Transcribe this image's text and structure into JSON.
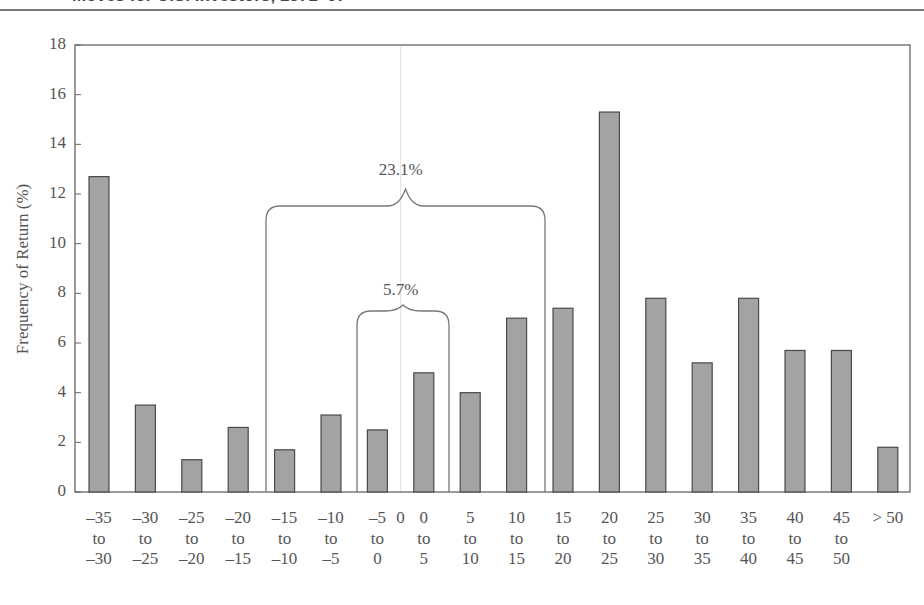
{
  "header": {
    "title_fragment": "Moves for U.S. Investors, 1871–07"
  },
  "chart_data": {
    "type": "bar",
    "title": "",
    "xlabel": "",
    "ylabel": "Frequency of Return (%)",
    "ylim": [
      0,
      18
    ],
    "yticks": [
      0,
      2,
      4,
      6,
      8,
      10,
      12,
      14,
      16,
      18
    ],
    "grid": false,
    "categories": [
      "-35 to -30",
      "-30 to -25",
      "-25 to -20",
      "-20 to -15",
      "-15 to -10",
      "-10 to -5",
      "-5 to 0",
      "0 to 5",
      "5 to 10",
      "10 to 15",
      "15 to 20",
      "20 to 25",
      "25 to 30",
      "30 to 35",
      "35 to 40",
      "40 to 45",
      "45 to 50",
      "> 50"
    ],
    "category_labels": [
      [
        "–35",
        "to",
        "–30"
      ],
      [
        "–30",
        "to",
        "–25"
      ],
      [
        "–25",
        "to",
        "–20"
      ],
      [
        "–20",
        "to",
        "–15"
      ],
      [
        "–15",
        "to",
        "–10"
      ],
      [
        "–10",
        "to",
        "–5"
      ],
      [
        "–5",
        "to",
        "0"
      ],
      [
        "0",
        "to",
        "5"
      ],
      [
        "5",
        "to",
        "10"
      ],
      [
        "10",
        "to",
        "15"
      ],
      [
        "15",
        "to",
        "20"
      ],
      [
        "20",
        "to",
        "25"
      ],
      [
        "25",
        "to",
        "30"
      ],
      [
        "30",
        "to",
        "35"
      ],
      [
        "35",
        "to",
        "40"
      ],
      [
        "40",
        "to",
        "45"
      ],
      [
        "45",
        "to",
        "50"
      ],
      [
        "> 50",
        "",
        ""
      ]
    ],
    "values": [
      12.7,
      3.5,
      1.3,
      2.6,
      1.7,
      3.1,
      2.5,
      4.8,
      4.0,
      7.0,
      7.4,
      15.3,
      7.8,
      5.2,
      7.8,
      5.7,
      5.7,
      1.8
    ],
    "zero_marker_label": "0",
    "annotations": [
      {
        "text": "23.1%",
        "span": [
          "-15 to -10",
          "10 to 15"
        ],
        "type": "brace"
      },
      {
        "text": "5.7%",
        "span": [
          "-5 to 0",
          "0 to 5"
        ],
        "type": "brace"
      }
    ],
    "colors": {
      "bar_fill": "#a3a3a3",
      "bar_stroke": "#4a4a4a",
      "axis": "#666666",
      "brace": "#777777",
      "zero_line": "#e6e6e6"
    }
  }
}
